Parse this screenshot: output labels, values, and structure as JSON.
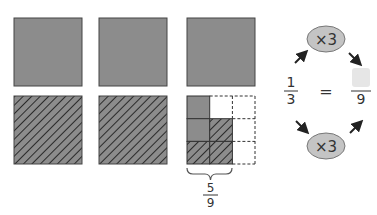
{
  "colors": {
    "fill": "#8c8c8c",
    "stroke": "#444444",
    "hatch": "#2a2a2a",
    "oval": "#c4c4c4",
    "blank_box": "#e6e6e6",
    "text": "#333333",
    "arrow": "#222222"
  },
  "diagram": {
    "top_row": [
      {
        "shape": "square",
        "style": "solid"
      },
      {
        "shape": "square",
        "style": "solid"
      },
      {
        "shape": "square",
        "style": "solid"
      }
    ],
    "bottom_row": [
      {
        "shape": "square",
        "style": "hatched"
      },
      {
        "shape": "square",
        "style": "hatched"
      },
      {
        "shape": "grid",
        "rows": 3,
        "cols": 3,
        "cells": [
          [
            "solid",
            "empty",
            "dashed"
          ],
          [
            "solid",
            "hatched",
            "dashed"
          ],
          [
            "hatched",
            "hatched",
            "dashed"
          ]
        ]
      }
    ],
    "brace_fraction": {
      "numerator": "5",
      "denominator": "9"
    },
    "equation": {
      "left": {
        "numerator": "1",
        "denominator": "3"
      },
      "equals": "=",
      "right": {
        "numerator": "",
        "denominator": "9",
        "numerator_blank": true
      },
      "top_multiplier": "×3",
      "bottom_multiplier": "×3"
    }
  }
}
